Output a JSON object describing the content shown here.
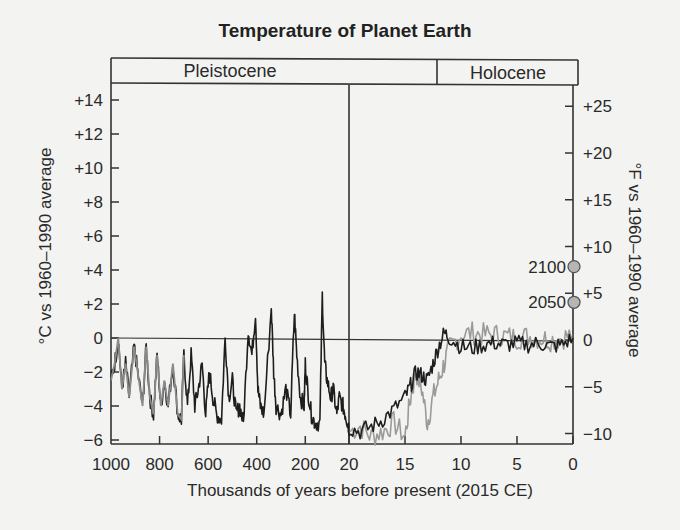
{
  "chart_data": {
    "type": "line",
    "title": "Temperature of Planet Earth",
    "xlabel": "Thousands of years before present (2015 CE)",
    "ylabel_left": "°C vs 1960–1990 average",
    "ylabel_right": "°F vs 1960–1990 average",
    "epochs": [
      {
        "name": "Pleistocene",
        "from_kyr": 1000,
        "to_kyr": 11.7
      },
      {
        "name": "Holocene",
        "from_kyr": 11.7,
        "to_kyr": 0
      }
    ],
    "x_axis": {
      "note": "broken scale: 1000–20 kyr compressed (linear), 20–0 kyr expanded",
      "tick_labels": [
        "1000",
        "800",
        "600",
        "400",
        "200",
        "20",
        "15",
        "10",
        "5",
        "0"
      ],
      "tick_values_kyr": [
        1000,
        800,
        600,
        400,
        200,
        20,
        15,
        10,
        5,
        0
      ]
    },
    "y_left": {
      "unit": "°C",
      "tick_labels": [
        "+14",
        "+12",
        "+10",
        "+8",
        "+6",
        "+4",
        "+2",
        "0",
        "−2",
        "−4",
        "−6"
      ],
      "ylim": [
        -6,
        15
      ]
    },
    "y_right": {
      "unit": "°F",
      "tick_labels": [
        "+25",
        "+20",
        "+15",
        "+10",
        "+5",
        "0",
        "−5",
        "−10"
      ]
    },
    "grid": false,
    "reference_line": {
      "y": 0,
      "label": "0"
    },
    "projections": [
      {
        "label": "2100",
        "celsius": 4.2,
        "fahrenheit": 7.6
      },
      {
        "label": "2050",
        "celsius": 2.1,
        "fahrenheit": 3.8
      }
    ],
    "series": [
      {
        "name": "Ice-core record (dark)",
        "color": "#1e1e1e",
        "points_kyr_celsius": [
          [
            1000,
            -2.5
          ],
          [
            985,
            -1.5
          ],
          [
            970,
            0.0
          ],
          [
            955,
            -3.0
          ],
          [
            940,
            -1.5
          ],
          [
            925,
            -3.5
          ],
          [
            905,
            -0.5
          ],
          [
            890,
            -2.0
          ],
          [
            870,
            -4.0
          ],
          [
            855,
            -0.5
          ],
          [
            840,
            -3.5
          ],
          [
            825,
            -4.5
          ],
          [
            810,
            -1.0
          ],
          [
            795,
            -4.0
          ],
          [
            780,
            -2.5
          ],
          [
            765,
            -4.0
          ],
          [
            745,
            -1.5
          ],
          [
            725,
            -4.5
          ],
          [
            710,
            -4.8
          ],
          [
            700,
            -1.0
          ],
          [
            685,
            -4.0
          ],
          [
            670,
            -1.0
          ],
          [
            655,
            -4.0
          ],
          [
            640,
            -3.0
          ],
          [
            625,
            -1.5
          ],
          [
            610,
            -4.5
          ],
          [
            595,
            -2.0
          ],
          [
            580,
            -3.5
          ],
          [
            565,
            -4.5
          ],
          [
            545,
            -4.8
          ],
          [
            530,
            0.0
          ],
          [
            515,
            -3.5
          ],
          [
            500,
            -2.5
          ],
          [
            485,
            -4.5
          ],
          [
            470,
            -4.0
          ],
          [
            455,
            -5.0
          ],
          [
            435,
            0.5
          ],
          [
            420,
            -1.0
          ],
          [
            405,
            1.5
          ],
          [
            395,
            -3.0
          ],
          [
            385,
            -4.0
          ],
          [
            370,
            -4.5
          ],
          [
            340,
            1.8
          ],
          [
            330,
            -2.0
          ],
          [
            320,
            -4.0
          ],
          [
            300,
            -4.5
          ],
          [
            280,
            -3.0
          ],
          [
            260,
            -4.5
          ],
          [
            245,
            1.5
          ],
          [
            235,
            -1.0
          ],
          [
            220,
            -3.5
          ],
          [
            205,
            -4.0
          ],
          [
            200,
            -1.5
          ],
          [
            190,
            -3.0
          ],
          [
            175,
            -4.5
          ],
          [
            160,
            -5.0
          ],
          [
            140,
            -5.0
          ],
          [
            130,
            2.5
          ],
          [
            120,
            -1.5
          ],
          [
            110,
            -2.5
          ],
          [
            95,
            -3.5
          ],
          [
            85,
            -3.0
          ],
          [
            70,
            -4.5
          ],
          [
            60,
            -3.5
          ],
          [
            45,
            -4.0
          ],
          [
            35,
            -4.5
          ],
          [
            25,
            -5.0
          ],
          [
            20,
            -5.3
          ],
          [
            19,
            -5.5
          ],
          [
            18,
            -5.2
          ],
          [
            17,
            -4.8
          ],
          [
            16,
            -4.2
          ],
          [
            15,
            -3.5
          ],
          [
            14.5,
            -2.8
          ],
          [
            14,
            -2.0
          ],
          [
            13.5,
            -2.2
          ],
          [
            13,
            -2.5
          ],
          [
            12.5,
            -1.5
          ],
          [
            12,
            -0.5
          ],
          [
            11.5,
            0.3
          ],
          [
            11,
            0.0
          ],
          [
            10,
            -0.5
          ],
          [
            9,
            -0.6
          ],
          [
            8,
            -0.4
          ],
          [
            7,
            -0.3
          ],
          [
            6,
            -0.4
          ],
          [
            5,
            -0.3
          ],
          [
            4,
            -0.4
          ],
          [
            3,
            -0.3
          ],
          [
            2,
            -0.5
          ],
          [
            1,
            -0.4
          ],
          [
            0,
            0.0
          ]
        ]
      },
      {
        "name": "Alternate reconstruction (light gray)",
        "color": "#9a9a9a",
        "points_kyr_celsius": [
          [
            20,
            -5.5
          ],
          [
            19,
            -5.2
          ],
          [
            18,
            -5.8
          ],
          [
            17,
            -5.5
          ],
          [
            16,
            -5.0
          ],
          [
            15,
            -5.8
          ],
          [
            14.5,
            -3.5
          ],
          [
            14,
            -2.0
          ],
          [
            13.5,
            -3.0
          ],
          [
            13,
            -5.0
          ],
          [
            12.5,
            -3.5
          ],
          [
            12,
            -2.5
          ],
          [
            11.5,
            -1.5
          ],
          [
            11,
            -0.5
          ],
          [
            10,
            0.2
          ],
          [
            9,
            0.3
          ],
          [
            8,
            0.2
          ],
          [
            7,
            0.2
          ],
          [
            6,
            0.1
          ],
          [
            5,
            0.0
          ],
          [
            4,
            0.1
          ],
          [
            3,
            0.0
          ],
          [
            2,
            -0.1
          ],
          [
            1,
            0.0
          ],
          [
            0,
            0.2
          ]
        ]
      }
    ]
  }
}
